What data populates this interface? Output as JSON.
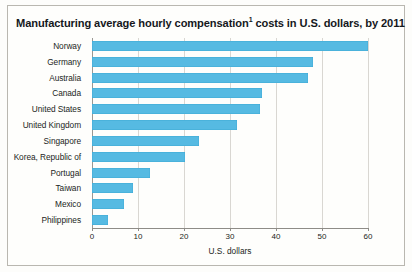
{
  "chart_data": {
    "type": "bar",
    "orientation": "horizontal",
    "title": "Manufacturing average hourly compensation",
    "title_footnote_marker": "1",
    "title_suffix": " costs in U.S. dollars, by 2011",
    "title_full": "Manufacturing average hourly compensation1 costs in U.S. dollars, by 2011",
    "categories": [
      "Norway",
      "Germany",
      "Australia",
      "Canada",
      "United States",
      "United Kingdom",
      "Singapore",
      "Korea, Republic of",
      "Portugal",
      "Taiwan",
      "Mexico",
      "Philippines"
    ],
    "values": [
      65,
      48,
      47,
      37,
      36.5,
      31.5,
      23.3,
      20.2,
      12.6,
      9,
      7,
      3.5
    ],
    "xlabel": "U.S. dollars",
    "ylabel": "",
    "xlim": [
      0,
      60
    ],
    "xticks": [
      0,
      10,
      20,
      30,
      40,
      50,
      60
    ],
    "xtick_labels": [
      "0",
      "10",
      "20",
      "30",
      "40",
      "50",
      "60"
    ],
    "grid": true,
    "grid_axis": "x",
    "legend": false,
    "bar_color": "#56bae2",
    "background_color": "#fefefc",
    "gridline_color": "#d9d7d2",
    "axis_color": "#8e8c87"
  }
}
